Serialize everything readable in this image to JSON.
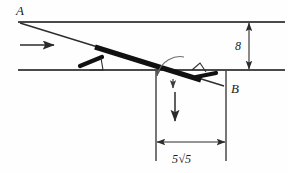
{
  "figure": {
    "kind": "mechanics-free-body-diagram",
    "labels": {
      "point_a": "A",
      "point_b": "B",
      "vertical_dimension": "8",
      "horizontal_dimension_prefix": "5",
      "horizontal_dimension_radical": "√5",
      "horizontal_dimension_full": "5√5"
    },
    "colors": {
      "background": "#fefefe",
      "line": "#3b3b3b",
      "bar": "#111111",
      "text": "#1a1a1a",
      "thin_line": "#555555"
    },
    "elements": [
      {
        "name": "upper-surface-line",
        "type": "horizontal-line"
      },
      {
        "name": "middle-surface-line",
        "type": "horizontal-line"
      },
      {
        "name": "right-surface-line",
        "type": "horizontal-line"
      },
      {
        "name": "inclined-guide-line",
        "type": "inclined-line"
      },
      {
        "name": "rod-bar",
        "type": "thick-bar"
      },
      {
        "name": "left-slider-block",
        "type": "slider-marker"
      },
      {
        "name": "right-slider-block",
        "type": "slider-marker"
      },
      {
        "name": "velocity-arrow",
        "type": "arrow-right"
      },
      {
        "name": "weight-arrow",
        "type": "arrow-down"
      },
      {
        "name": "rotation-arc-arrow",
        "type": "curved-arrow"
      },
      {
        "name": "vertical-dimension",
        "type": "double-arrow-vertical"
      },
      {
        "name": "horizontal-dimension",
        "type": "double-arrow-horizontal"
      }
    ]
  },
  "geometry": {
    "top_line_y": 22,
    "mid_line_y": 70,
    "point_a_x": 18,
    "point_b_x": 226,
    "dim_left_x": 156,
    "dim_right_x": 226,
    "dim_y": 142,
    "vertical_dim_x": 249,
    "vertical_dim_top": 22,
    "vertical_dim_bottom": 70
  }
}
